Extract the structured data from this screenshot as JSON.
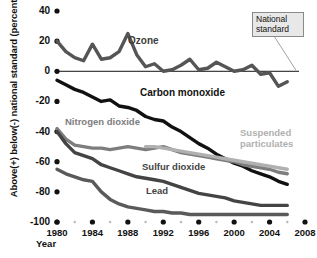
{
  "chart_data": {
    "type": "line",
    "title": "",
    "subtitle": "",
    "xlabel": "Year",
    "ylabel": "Above(+) below(-) national standard (percent)",
    "xlim": [
      1980,
      2008
    ],
    "ylim": [
      -100,
      40
    ],
    "grid": false,
    "legend_position": "inline-labels",
    "yticks": [
      40,
      20,
      0,
      -20,
      -40,
      -60,
      -80,
      -100
    ],
    "ytick_labels": [
      "40",
      "20",
      "0",
      "-20",
      "-40",
      "-60",
      "-80",
      "-100"
    ],
    "xticks": [
      1980,
      1984,
      1988,
      1992,
      1996,
      2000,
      2004,
      2008
    ],
    "xtick_labels": [
      "1980",
      "1984",
      "1988",
      "1992",
      "1996",
      "2000",
      "2004",
      "2008"
    ],
    "xminor_ticks": [
      1982,
      1986,
      1990,
      1994,
      1998,
      2002,
      2006
    ],
    "annotations": [
      {
        "name": "national-standard-callout",
        "text": "National standard",
        "points_to_y": 0,
        "points_to_x": 2006
      }
    ],
    "series": [
      {
        "name": "Ozone",
        "color": "#555555",
        "label_color": "#3c3c3c",
        "x": [
          1980,
          1981,
          1982,
          1983,
          1984,
          1985,
          1986,
          1987,
          1988,
          1989,
          1990,
          1991,
          1992,
          1993,
          1994,
          1995,
          1996,
          1997,
          1998,
          1999,
          2000,
          2001,
          2002,
          2003,
          2004,
          2005,
          2006
        ],
        "values": [
          20,
          13,
          9,
          7,
          18,
          8,
          9,
          13,
          25,
          11,
          3,
          5,
          0,
          1,
          4,
          8,
          1,
          2,
          6,
          3,
          0,
          1,
          4,
          -2,
          -1,
          -10,
          -7
        ]
      },
      {
        "name": "Carbon monoxide",
        "color": "#111111",
        "label_color": "#111111",
        "x": [
          1980,
          1981,
          1982,
          1983,
          1984,
          1985,
          1986,
          1987,
          1988,
          1989,
          1990,
          1991,
          1992,
          1993,
          1994,
          1995,
          1996,
          1997,
          1998,
          1999,
          2000,
          2001,
          2002,
          2003,
          2004,
          2005,
          2006
        ],
        "values": [
          -6,
          -9,
          -12,
          -14,
          -17,
          -20,
          -19,
          -23,
          -24,
          -26,
          -30,
          -32,
          -33,
          -37,
          -40,
          -44,
          -48,
          -51,
          -55,
          -58,
          -61,
          -63,
          -66,
          -68,
          -70,
          -73,
          -75
        ]
      },
      {
        "name": "Nitrogen dioxide",
        "color": "#7d7d7d",
        "label_color": "#7d7d7d",
        "x": [
          1980,
          1981,
          1982,
          1983,
          1984,
          1985,
          1986,
          1987,
          1988,
          1989,
          1990,
          1991,
          1992,
          1993,
          1994,
          1995,
          1996,
          1997,
          1998,
          1999,
          2000,
          2001,
          2002,
          2003,
          2004,
          2005,
          2006
        ],
        "values": [
          -38,
          -45,
          -49,
          -50,
          -51,
          -51,
          -52,
          -51,
          -50,
          -51,
          -52,
          -51,
          -50,
          -52,
          -54,
          -55,
          -56,
          -57,
          -58,
          -59,
          -60,
          -62,
          -63,
          -64,
          -65,
          -67,
          -68
        ]
      },
      {
        "name": "Suspended particulates",
        "color": "#b0b0b0",
        "label_color": "#b0b0b0",
        "x": [
          1990,
          1991,
          1992,
          1993,
          1994,
          1995,
          1996,
          1997,
          1998,
          1999,
          2000,
          2001,
          2002,
          2003,
          2004,
          2005,
          2006
        ],
        "values": [
          -50,
          -50,
          -51,
          -52,
          -53,
          -54,
          -55,
          -56,
          -57,
          -58,
          -59,
          -60,
          -61,
          -62,
          -63,
          -64,
          -65
        ]
      },
      {
        "name": "Sulfur dioxide",
        "color": "#444444",
        "label_color": "#444444",
        "x": [
          1980,
          1981,
          1982,
          1983,
          1984,
          1985,
          1986,
          1987,
          1988,
          1989,
          1990,
          1991,
          1992,
          1993,
          1994,
          1995,
          1996,
          1997,
          1998,
          1999,
          2000,
          2001,
          2002,
          2003,
          2004,
          2005,
          2006
        ],
        "values": [
          -40,
          -48,
          -54,
          -56,
          -58,
          -62,
          -64,
          -66,
          -68,
          -70,
          -71,
          -72,
          -73,
          -75,
          -77,
          -79,
          -81,
          -82,
          -83,
          -84,
          -86,
          -87,
          -88,
          -89,
          -89,
          -89,
          -89
        ]
      },
      {
        "name": "Lead",
        "color": "#5a5a5a",
        "label_color": "#444444",
        "x": [
          1980,
          1981,
          1982,
          1983,
          1984,
          1985,
          1986,
          1987,
          1988,
          1989,
          1990,
          1991,
          1992,
          1993,
          1994,
          1995,
          1996,
          1997,
          1998,
          1999,
          2000,
          2001,
          2002,
          2003,
          2004,
          2005,
          2006
        ],
        "values": [
          -65,
          -68,
          -70,
          -72,
          -73,
          -80,
          -85,
          -88,
          -90,
          -91,
          -92,
          -93,
          -93,
          -94,
          -94,
          -95,
          -95,
          -95,
          -95,
          -95,
          -95,
          -95,
          -95,
          -95,
          -95,
          -95,
          -95
        ]
      }
    ]
  }
}
